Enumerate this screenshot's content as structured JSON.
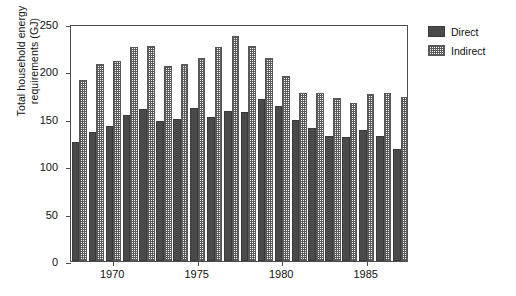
{
  "chart_data": {
    "type": "bar",
    "title": "",
    "subtitle": "",
    "xlabel": "",
    "ylabel": "Total household energy\nrequirements (GJ)",
    "ylim": [
      0,
      250
    ],
    "yticks": [
      0,
      50,
      100,
      150,
      200,
      250
    ],
    "xticks": [
      1970,
      1975,
      1980,
      1985
    ],
    "grid": false,
    "legend_position": "top-right",
    "categories": [
      1968,
      1969,
      1970,
      1971,
      1972,
      1973,
      1974,
      1975,
      1976,
      1977,
      1978,
      1979,
      1980,
      1981,
      1982,
      1983,
      1984,
      1985,
      1986,
      1987
    ],
    "series": [
      {
        "name": "Direct",
        "color": "#4a4a4a",
        "pattern": "solid",
        "values": [
          126,
          136,
          142,
          154,
          160,
          148,
          150,
          161,
          152,
          158,
          157,
          171,
          163,
          149,
          140,
          132,
          131,
          138,
          132,
          118
        ]
      },
      {
        "name": "Indirect",
        "color": "#5a5a5a",
        "pattern": "dotted-grid",
        "values": [
          191,
          208,
          211,
          226,
          227,
          206,
          208,
          214,
          226,
          237,
          227,
          214,
          195,
          177,
          177,
          172,
          167,
          176,
          177,
          173
        ]
      }
    ]
  },
  "legend": {
    "items": [
      {
        "label": "Direct"
      },
      {
        "label": "Indirect"
      }
    ]
  }
}
